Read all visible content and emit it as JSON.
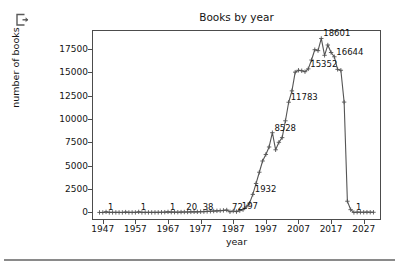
{
  "window": {
    "background": "#ffffff",
    "icons": [
      {
        "name": "export-icon",
        "glyph": "box-with-arrow-out"
      }
    ]
  },
  "colors": {
    "line": "#555555",
    "marker": "#555555",
    "axis": "#4c4c4c",
    "text": "#141414",
    "divider": "#8a8a8a"
  },
  "chart_data": {
    "type": "line",
    "title": "Books by year",
    "xlabel": "year",
    "ylabel": "number of books",
    "xlim": [
      1944,
      2032
    ],
    "ylim": [
      -700,
      19400
    ],
    "grid": false,
    "legend": null,
    "marker": "+",
    "xticks": [
      1947,
      1957,
      1967,
      1977,
      1987,
      1997,
      2007,
      2017,
      2027
    ],
    "xtick_labels": [
      "1947",
      "1957",
      "1967",
      "1977",
      "1987",
      "1997",
      "2007",
      "2017",
      "2027"
    ],
    "yticks": [
      0,
      2500,
      5000,
      7500,
      10000,
      12500,
      15000,
      17500
    ],
    "ytick_labels": [
      "0",
      "2500",
      "5000",
      "7500",
      "10000",
      "12500",
      "15000",
      "17500"
    ],
    "x": [
      1946,
      1947,
      1948,
      1949,
      1950,
      1951,
      1952,
      1953,
      1954,
      1955,
      1956,
      1957,
      1958,
      1959,
      1960,
      1961,
      1962,
      1963,
      1964,
      1965,
      1966,
      1967,
      1968,
      1969,
      1970,
      1971,
      1972,
      1973,
      1974,
      1975,
      1976,
      1977,
      1978,
      1979,
      1980,
      1981,
      1982,
      1983,
      1984,
      1985,
      1986,
      1987,
      1988,
      1989,
      1990,
      1991,
      1992,
      1993,
      1994,
      1995,
      1996,
      1997,
      1998,
      1999,
      2000,
      2001,
      2002,
      2003,
      2004,
      2005,
      2006,
      2007,
      2008,
      2009,
      2010,
      2011,
      2012,
      2013,
      2014,
      2015,
      2016,
      2017,
      2018,
      2019,
      2020,
      2021,
      2022,
      2023,
      2024,
      2025,
      2026,
      2027,
      2028,
      2029,
      2030
    ],
    "values": [
      2,
      1,
      60,
      5,
      4,
      3,
      3,
      2,
      40,
      3,
      4,
      4,
      60,
      5,
      4,
      6,
      5,
      8,
      9,
      20,
      30,
      60,
      35,
      30,
      28,
      40,
      45,
      50,
      60,
      70,
      65,
      80,
      90,
      110,
      130,
      150,
      170,
      190,
      220,
      260,
      72,
      150,
      90,
      197,
      300,
      600,
      1000,
      1932,
      3100,
      4300,
      5500,
      6200,
      7000,
      8528,
      6700,
      7500,
      8000,
      9800,
      11783,
      13000,
      15000,
      15200,
      15150,
      15050,
      15352,
      16300,
      17400,
      17300,
      18601,
      16800,
      17900,
      17100,
      16644,
      15300,
      15200,
      11800,
      1200,
      300,
      1,
      30,
      25,
      20,
      30,
      25,
      20
    ],
    "annotations": [
      {
        "label": "1",
        "x": 1948,
        "y": 60
      },
      {
        "label": "1",
        "x": 1958,
        "y": 60
      },
      {
        "label": "1",
        "x": 1967,
        "y": 60
      },
      {
        "label": "20",
        "x": 1972,
        "y": 45
      },
      {
        "label": "38",
        "x": 1977,
        "y": 80
      },
      {
        "label": "72",
        "x": 1986,
        "y": 72
      },
      {
        "label": "197",
        "x": 1989,
        "y": 197
      },
      {
        "label": "1932",
        "x": 1993,
        "y": 1932
      },
      {
        "label": "8528",
        "x": 1999,
        "y": 8528
      },
      {
        "label": "11783",
        "x": 2004,
        "y": 11783
      },
      {
        "label": "15352",
        "x": 2010,
        "y": 15352
      },
      {
        "label": "18601",
        "x": 2014,
        "y": 18601
      },
      {
        "label": "16644",
        "x": 2018,
        "y": 16644
      },
      {
        "label": "1",
        "x": 2024,
        "y": 1
      }
    ]
  }
}
